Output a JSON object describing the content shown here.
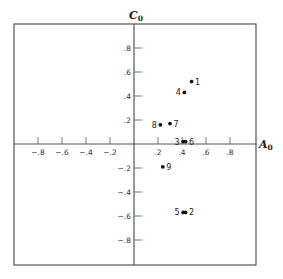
{
  "chart_data": {
    "type": "scatter",
    "title": "",
    "xlabel": "A0",
    "ylabel": "C0",
    "xlim": [
      -1.0,
      1.0
    ],
    "ylim": [
      -1.0,
      1.0
    ],
    "grid": false,
    "legend": null,
    "x_ticks": [
      -0.8,
      -0.6,
      -0.4,
      -0.2,
      0.2,
      0.4,
      0.6,
      0.8
    ],
    "x_tick_labels": [
      "−.8",
      "−.6",
      "−.4",
      "−.2",
      ".2",
      ".4",
      ".6",
      ".8"
    ],
    "y_ticks": [
      0.8,
      0.6,
      0.4,
      0.2,
      -0.2,
      -0.4,
      -0.6,
      -0.8
    ],
    "y_tick_labels": [
      ".8",
      ".6",
      ".4",
      ".2",
      "−.2",
      "−.4",
      "−.6",
      "−.8"
    ],
    "points": [
      {
        "label": "1",
        "x": 0.48,
        "y": 0.52,
        "label_side": "right"
      },
      {
        "label": "2",
        "x": 0.43,
        "y": -0.57,
        "label_side": "right"
      },
      {
        "label": "3",
        "x": 0.41,
        "y": 0.02,
        "label_side": "left"
      },
      {
        "label": "4",
        "x": 0.42,
        "y": 0.43,
        "label_side": "left"
      },
      {
        "label": "5",
        "x": 0.41,
        "y": -0.57,
        "label_side": "left"
      },
      {
        "label": "6",
        "x": 0.43,
        "y": 0.02,
        "label_side": "right"
      },
      {
        "label": "7",
        "x": 0.3,
        "y": 0.17,
        "label_side": "right"
      },
      {
        "label": "8",
        "x": 0.22,
        "y": 0.16,
        "label_side": "left"
      },
      {
        "label": "9",
        "x": 0.24,
        "y": -0.19,
        "label_side": "right"
      }
    ]
  },
  "axes": {
    "x_title_main": "A",
    "x_title_sub": "0",
    "y_title_main": "C",
    "y_title_sub": "0"
  },
  "colors": {
    "frame": "#555555",
    "axis": "#555555",
    "point": "#111111"
  }
}
